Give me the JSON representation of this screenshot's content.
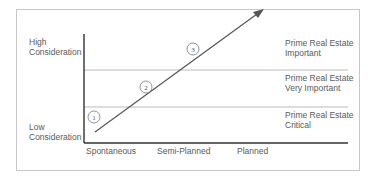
{
  "y_axis": {
    "high_label_line1": "High",
    "high_label_line2": "Consideration",
    "low_label_line1": "Low",
    "low_label_line2": "Consideration"
  },
  "x_axis": {
    "ticks": [
      "Spontaneous",
      "Semi-Planned",
      "Planned"
    ]
  },
  "zones": [
    {
      "line1": "Prime Real Estate",
      "line2": "Important"
    },
    {
      "line1": "Prime Real Estate",
      "line2": "Very Important"
    },
    {
      "line1": "Prime Real Estate",
      "line2": "Critical"
    }
  ],
  "markers": [
    "1",
    "2",
    "3"
  ],
  "colors": {
    "axis": "#333333",
    "gridline": "#bbbbbb",
    "arrow": "#555555",
    "frame": "#c8c8c8",
    "text": "#5a5a5a"
  }
}
